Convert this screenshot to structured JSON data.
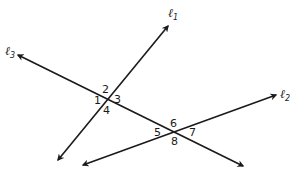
{
  "diagram": {
    "lines": [
      {
        "id": "l1",
        "label": "ℓ",
        "subscript": "1",
        "from": [
          58,
          160
        ],
        "to": [
          168,
          26
        ],
        "label_pos": [
          170,
          16
        ]
      },
      {
        "id": "l2",
        "label": "ℓ",
        "subscript": "2",
        "from": [
          83,
          165
        ],
        "to": [
          276,
          95
        ],
        "label_pos": [
          281,
          97
        ]
      },
      {
        "id": "l3",
        "label": "ℓ",
        "subscript": "3",
        "from": [
          18,
          55
        ],
        "to": [
          243,
          166
        ],
        "label_pos": [
          5,
          55
        ]
      }
    ],
    "intersections": [
      {
        "lines": [
          "l1",
          "l3"
        ],
        "point": [
          107,
          98
        ]
      },
      {
        "lines": [
          "l2",
          "l3"
        ],
        "point": [
          175,
          131
        ]
      }
    ],
    "angles": [
      {
        "number": "1",
        "pos": [
          93,
          104
        ]
      },
      {
        "number": "2",
        "pos": [
          103,
          91
        ]
      },
      {
        "number": "3",
        "pos": [
          115,
          102
        ]
      },
      {
        "number": "4",
        "pos": [
          104,
          113
        ]
      },
      {
        "number": "5",
        "pos": [
          155,
          135
        ]
      },
      {
        "number": "6",
        "pos": [
          171,
          126
        ]
      },
      {
        "number": "7",
        "pos": [
          190,
          135
        ]
      },
      {
        "number": "8",
        "pos": [
          172,
          145
        ]
      }
    ],
    "color": "#1a1a1a"
  }
}
